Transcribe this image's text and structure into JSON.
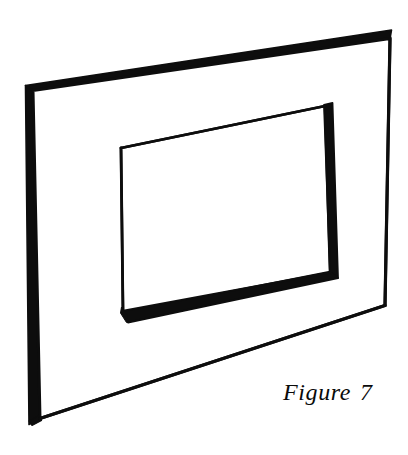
{
  "figure": {
    "caption_label": "Figure",
    "caption_number": "7",
    "caption_full": "Figure 7",
    "style": "black and white line drawing",
    "ink_color": "#0a0a0a",
    "paper_color": "#ffffff"
  },
  "geometry": {
    "outer_plate": {
      "name": "outer-plate-face",
      "corners": {
        "top_left": [
          33,
          90
        ],
        "top_right": [
          390,
          38
        ],
        "bottom_right": [
          385,
          305
        ],
        "bottom_left": [
          40,
          418
        ]
      }
    },
    "outer_thickness": {
      "name": "plate-edge-thickness",
      "left_band": [
        [
          22,
          97
        ],
        [
          33,
          90
        ],
        [
          40,
          418
        ],
        [
          29,
          424
        ]
      ],
      "top_band": [
        [
          22,
          97
        ],
        [
          25,
          86
        ],
        [
          391,
          31
        ],
        [
          390,
          38
        ]
      ]
    },
    "inner_hole": {
      "name": "inner-hole-face",
      "corners": {
        "top_left": [
          121,
          148
        ],
        "top_right": [
          325,
          106
        ],
        "bottom_right": [
          330,
          272
        ],
        "bottom_left": [
          123,
          313
        ]
      }
    },
    "inner_thickness": {
      "name": "hole-wall-thickness",
      "right_band": [
        [
          325,
          106
        ],
        [
          332,
          104
        ],
        [
          337,
          277
        ],
        [
          330,
          272
        ]
      ],
      "bottom_band": [
        [
          123,
          313
        ],
        [
          330,
          272
        ],
        [
          337,
          277
        ],
        [
          128,
          321
        ]
      ]
    }
  }
}
